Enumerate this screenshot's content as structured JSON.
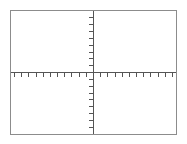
{
  "figure": {
    "kind": "blank-cartesian-coordinate-plane",
    "caption": "",
    "has_caption": false,
    "background_color": "#ffffff",
    "frame": {
      "name": "plot-frame",
      "left": 10,
      "top": 10,
      "width": 167,
      "height": 125,
      "border_color": "#8c8c8c",
      "border_width": 1,
      "fill_color": "#ffffff"
    },
    "axis_color": "#555555",
    "axis_width": 1,
    "origin": {
      "x": 93,
      "y": 72
    },
    "tick_color": "#555555",
    "tick_length": 4,
    "tick_width": 1
  },
  "chart_data": {
    "type": "line",
    "title": "",
    "subtitle": "",
    "xlabel": "",
    "ylabel": "",
    "series": [
      {
        "name": "none",
        "x": [],
        "y": []
      }
    ],
    "x": [],
    "categories": [],
    "values": [],
    "xlim": [
      -11,
      12
    ],
    "ylim": [
      -9,
      9
    ],
    "x_tick_step": 1,
    "y_tick_step": 1,
    "x_tick_values": [
      -11,
      -10,
      -9,
      -8,
      -7,
      -6,
      -5,
      -4,
      -3,
      -2,
      -1,
      1,
      2,
      3,
      4,
      5,
      6,
      7,
      8,
      9,
      10,
      11,
      12
    ],
    "y_tick_values": [
      -9,
      -8,
      -7,
      -6,
      -5,
      -4,
      -3,
      -2,
      -1,
      1,
      2,
      3,
      4,
      5,
      6,
      7,
      8,
      9
    ],
    "x_tick_labels": [],
    "y_tick_labels": [],
    "x_tick_direction": "down",
    "y_tick_direction": "left",
    "grid": false,
    "legend": false,
    "legend_position": "none",
    "annotations": [],
    "data_labels": []
  }
}
